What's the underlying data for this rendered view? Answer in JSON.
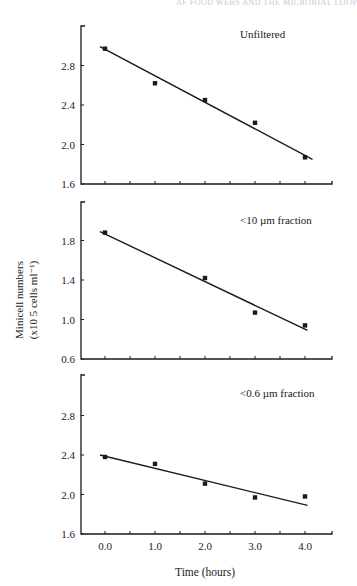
{
  "header": {
    "running_head": "AF FOOD WEBS AND THE MICROBIAL LOOP"
  },
  "axes": {
    "ylabel_line1": "Minicell numbers",
    "ylabel_line2": "(x10 5 cells ml⁻¹)",
    "xlabel": "Time (hours)",
    "x_ticks": [
      "0.0",
      "1.0",
      "2.0",
      "3.0",
      "4.0"
    ]
  },
  "chart_data": [
    {
      "type": "scatter",
      "title": "Unfiltered",
      "xlabel": "Time (hours)",
      "ylabel": "Minicell numbers (x10^5 cells ml^-1)",
      "x": [
        0.0,
        1.0,
        2.0,
        3.0,
        4.0
      ],
      "values": [
        2.97,
        2.62,
        2.45,
        2.22,
        1.87
      ],
      "trendline": {
        "x": [
          -0.1,
          4.15
        ],
        "y": [
          2.99,
          1.85
        ]
      },
      "yticks": [
        "1.6",
        "2.0",
        "2.4",
        "2.8"
      ],
      "ylim": [
        1.6,
        3.2
      ],
      "xlim": [
        -0.5,
        4.5
      ],
      "grid": false
    },
    {
      "type": "scatter",
      "title": "<10 µm fraction",
      "xlabel": "Time (hours)",
      "ylabel": "Minicell numbers (x10^5 cells ml^-1)",
      "x": [
        0.0,
        2.0,
        3.0,
        4.0
      ],
      "values": [
        1.88,
        1.42,
        1.07,
        0.94
      ],
      "trendline": {
        "x": [
          -0.1,
          4.05
        ],
        "y": [
          1.89,
          0.89
        ]
      },
      "yticks": [
        "0.6",
        "1.0",
        "1.4",
        "1.8"
      ],
      "ylim": [
        0.6,
        2.2
      ],
      "xlim": [
        -0.5,
        4.5
      ],
      "grid": false
    },
    {
      "type": "scatter",
      "title": "<0.6 µm fraction",
      "xlabel": "Time (hours)",
      "ylabel": "Minicell numbers (x10^5 cells ml^-1)",
      "x": [
        0.0,
        1.0,
        2.0,
        3.0,
        4.0
      ],
      "values": [
        2.38,
        2.31,
        2.11,
        1.97,
        1.98
      ],
      "trendline": {
        "x": [
          -0.1,
          4.05
        ],
        "y": [
          2.4,
          1.89
        ]
      },
      "yticks": [
        "1.6",
        "2.0",
        "2.4",
        "2.8"
      ],
      "ylim": [
        1.6,
        3.2
      ],
      "xlim": [
        -0.5,
        4.5
      ],
      "grid": false
    }
  ],
  "style": {
    "ink": "#1a1a1a",
    "background": "#ffffff"
  }
}
